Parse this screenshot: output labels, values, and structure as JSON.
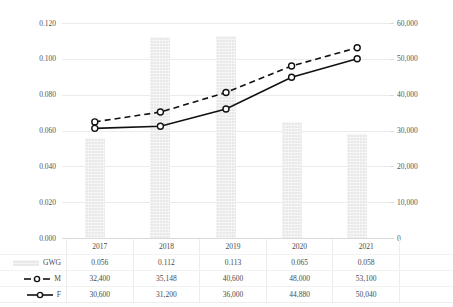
{
  "chart_data": {
    "type": "bar",
    "title": "",
    "xlabel": "",
    "ylabel": "",
    "categories": [
      "2017",
      "2018",
      "2019",
      "2020",
      "2021"
    ],
    "grid": true,
    "legend_position": "bottom-table",
    "axes": {
      "left": {
        "label": "",
        "ylim": [
          0.0,
          0.12
        ],
        "tick_step": 0.02,
        "ticks": [
          "0.120",
          "0.100",
          "0.080",
          "0.060",
          "0.040",
          "0.020",
          "0.000"
        ],
        "tick_values": [
          0.12,
          0.1,
          0.08,
          0.06,
          0.04,
          0.02,
          0.0
        ]
      },
      "right": {
        "label": "",
        "ylim": [
          0,
          60000
        ],
        "tick_step": 10000,
        "ticks": [
          "60,000",
          "50,000",
          "40,000",
          "30,000",
          "20,000",
          "10,000",
          "0"
        ],
        "tick_values": [
          60000,
          50000,
          40000,
          30000,
          20000,
          10000,
          0
        ]
      }
    },
    "series": [
      {
        "name": "GWG",
        "type": "bar",
        "axis": "left",
        "color": "#e9e9e9",
        "values": [
          0.056,
          0.112,
          0.113,
          0.065,
          0.058
        ],
        "labels": [
          "0.056",
          "0.112",
          "0.113",
          "0.065",
          "0.058"
        ]
      },
      {
        "name": "M",
        "type": "line",
        "axis": "right",
        "dash": "dashed",
        "color": "#111111",
        "marker": "open-circle",
        "values": [
          32400,
          35148,
          40600,
          48000,
          53100
        ],
        "labels": [
          "32,400",
          "35,148",
          "40,600",
          "48,000",
          "53,100"
        ]
      },
      {
        "name": "F",
        "type": "line",
        "axis": "right",
        "dash": "solid",
        "color": "#111111",
        "marker": "open-circle",
        "values": [
          30600,
          31200,
          36000,
          44880,
          50040
        ],
        "labels": [
          "30,600",
          "31,200",
          "36,000",
          "44,880",
          "50,040"
        ]
      }
    ]
  },
  "legend": {
    "gwg_label": "GWG",
    "m_label": "M",
    "f_label": "F"
  }
}
